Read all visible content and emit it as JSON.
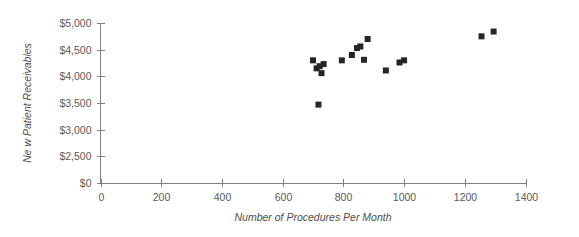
{
  "chart_data": {
    "type": "scatter",
    "title": "",
    "xlabel": "Number of Procedures Per Month",
    "ylabel": "Ne w Patient Receivables",
    "xlim": [
      0,
      1400
    ],
    "ylim": [
      0,
      5000
    ],
    "grid": false,
    "legend": false,
    "marker_color": "#262626",
    "marker_shape": "square",
    "axis_color": "#808080",
    "x_ticks": [
      0,
      200,
      400,
      600,
      800,
      1000,
      1200,
      1400
    ],
    "x_tick_labels": [
      "0",
      "200",
      "400",
      "600",
      "800",
      "1000",
      "1200",
      "1400"
    ],
    "y_ticks": [
      0,
      2500,
      3000,
      3500,
      4000,
      4500,
      5000
    ],
    "y_tick_labels": [
      "$0",
      "$2,500",
      "$3,000",
      "$3,500",
      "$4,000",
      "$4,500",
      "$5,000"
    ],
    "y_axis_note": "broken axis: $0 tick sits one even step below $2,500",
    "points": [
      {
        "x": 700,
        "y": 4300
      },
      {
        "x": 712,
        "y": 4150
      },
      {
        "x": 722,
        "y": 4190
      },
      {
        "x": 728,
        "y": 4060
      },
      {
        "x": 735,
        "y": 4230
      },
      {
        "x": 718,
        "y": 3470
      },
      {
        "x": 795,
        "y": 4300
      },
      {
        "x": 828,
        "y": 4400
      },
      {
        "x": 845,
        "y": 4530
      },
      {
        "x": 856,
        "y": 4560
      },
      {
        "x": 868,
        "y": 4310
      },
      {
        "x": 880,
        "y": 4700
      },
      {
        "x": 940,
        "y": 4110
      },
      {
        "x": 985,
        "y": 4260
      },
      {
        "x": 1000,
        "y": 4300
      },
      {
        "x": 1255,
        "y": 4750
      },
      {
        "x": 1295,
        "y": 4840
      }
    ]
  }
}
